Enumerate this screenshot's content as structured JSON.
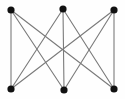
{
  "figure": {
    "width": 125,
    "height": 99,
    "background_color": "#fefefe"
  },
  "style": {
    "edge_color": "#7a7a7a",
    "edge_width": 1.1,
    "node_color": "#111111",
    "node_radius": 3.6
  },
  "graph_data": {
    "type": "diagram",
    "graph_kind": "complete-bipartite",
    "notation": "K3,3",
    "vertex_count": 6,
    "edge_count": 9,
    "partitions": {
      "top": [
        "t1",
        "t2",
        "t3"
      ],
      "bottom": [
        "b1",
        "b2",
        "b3"
      ]
    },
    "nodes": [
      {
        "id": "t1",
        "group": "top",
        "x": 11,
        "y": 10
      },
      {
        "id": "t2",
        "group": "top",
        "x": 63,
        "y": 9
      },
      {
        "id": "t3",
        "group": "top",
        "x": 114,
        "y": 10
      },
      {
        "id": "b1",
        "group": "bottom",
        "x": 11,
        "y": 89
      },
      {
        "id": "b2",
        "group": "bottom",
        "x": 64,
        "y": 90
      },
      {
        "id": "b3",
        "group": "bottom",
        "x": 114,
        "y": 89
      }
    ],
    "edges": [
      {
        "source": "t1",
        "target": "b1"
      },
      {
        "source": "t1",
        "target": "b2"
      },
      {
        "source": "t1",
        "target": "b3"
      },
      {
        "source": "t2",
        "target": "b1"
      },
      {
        "source": "t2",
        "target": "b2"
      },
      {
        "source": "t2",
        "target": "b3"
      },
      {
        "source": "t3",
        "target": "b1"
      },
      {
        "source": "t3",
        "target": "b2"
      },
      {
        "source": "t3",
        "target": "b3"
      }
    ]
  }
}
